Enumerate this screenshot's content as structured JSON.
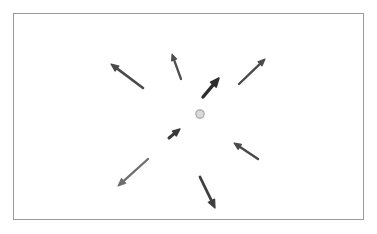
{
  "figure": {
    "width": 377,
    "height": 234,
    "background_color": "#ffffff"
  },
  "frame": {
    "name": "plot-border",
    "x": 13.5,
    "y": 13.5,
    "width": 350,
    "height": 206,
    "stroke_color": "#9a9a9a",
    "stroke_width": 1,
    "fill_color": "#ffffff"
  },
  "center_dot": {
    "label": "fixation point",
    "cx": 200,
    "cy": 114,
    "r": 4.2,
    "fill_color": "#d9d9d9",
    "stroke_color": "#a8a8a8",
    "stroke_width": 1.2
  },
  "chart_data": {
    "type": "scatter",
    "title": "",
    "xlabel": "",
    "ylabel": "",
    "xlim": [
      13,
      364
    ],
    "ylim": [
      13,
      220
    ],
    "grid": false,
    "legend": "none",
    "annotations": "eight directional arrows distributed radially around a central gray fixation dot",
    "arrows": [
      {
        "id": "arrow-upper-left",
        "tail_x": 143,
        "tail_y": 88,
        "tip_x": 111,
        "tip_y": 64,
        "angle_deg": 216.9,
        "length_px": 40,
        "color": "#4a4a4a",
        "stroke_width": 2.6,
        "head_size": 5.2
      },
      {
        "id": "arrow-top-center",
        "tail_x": 181,
        "tail_y": 79,
        "tip_x": 172,
        "tip_y": 54,
        "angle_deg": 250.2,
        "length_px": 26.6,
        "color": "#4f4f4f",
        "stroke_width": 2.3,
        "head_size": 4.4
      },
      {
        "id": "arrow-top-right",
        "tail_x": 239,
        "tail_y": 84,
        "tip_x": 265,
        "tip_y": 59,
        "angle_deg": 316.1,
        "length_px": 36,
        "color": "#4a4a4a",
        "stroke_width": 2.4,
        "head_size": 4.8
      },
      {
        "id": "arrow-inner-upper-right",
        "tail_x": 203,
        "tail_y": 97,
        "tip_x": 219,
        "tip_y": 78,
        "angle_deg": 310.1,
        "length_px": 24.8,
        "color": "#2e2e2e",
        "stroke_width": 3.4,
        "head_size": 6.0
      },
      {
        "id": "arrow-inner-lower-left",
        "tail_x": 169,
        "tail_y": 138,
        "tip_x": 180,
        "tip_y": 129,
        "angle_deg": 320.7,
        "length_px": 14.2,
        "color": "#3a3a3a",
        "stroke_width": 3.0,
        "head_size": 5.0
      },
      {
        "id": "arrow-right-lower",
        "tail_x": 258,
        "tail_y": 159,
        "tip_x": 234,
        "tip_y": 143,
        "angle_deg": 213.7,
        "length_px": 28.8,
        "color": "#4a4a4a",
        "stroke_width": 2.5,
        "head_size": 4.8
      },
      {
        "id": "arrow-lower-left",
        "tail_x": 148,
        "tail_y": 159,
        "tip_x": 118,
        "tip_y": 186,
        "angle_deg": 138.0,
        "length_px": 40.4,
        "color": "#6e6e6e",
        "stroke_width": 2.3,
        "head_size": 5.2
      },
      {
        "id": "arrow-bottom-center",
        "tail_x": 200,
        "tail_y": 177,
        "tip_x": 215,
        "tip_y": 208,
        "angle_deg": 64.2,
        "length_px": 34.4,
        "color": "#3f3f3f",
        "stroke_width": 2.8,
        "head_size": 5.6
      }
    ]
  }
}
